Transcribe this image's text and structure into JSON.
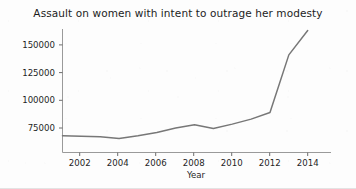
{
  "chart_data": {
    "type": "line",
    "title": "Assault on women with intent to outrage her modesty",
    "xlabel": "Year",
    "ylabel": "",
    "x": [
      2001,
      2002,
      2003,
      2004,
      2005,
      2006,
      2007,
      2008,
      2009,
      2010,
      2011,
      2012,
      2013,
      2014
    ],
    "values": [
      68000,
      67500,
      67000,
      65500,
      68000,
      71000,
      75000,
      78000,
      74500,
      78500,
      83000,
      89000,
      141000,
      163000
    ],
    "series": [
      {
        "name": "Assault on women with intent to outrage her modesty",
        "values": [
          68000,
          67500,
          67000,
          65500,
          68000,
          71000,
          75000,
          78000,
          74500,
          78500,
          83000,
          89000,
          141000,
          163000
        ]
      }
    ],
    "xticks": [
      2002,
      2004,
      2006,
      2008,
      2010,
      2012,
      2014
    ],
    "xtick_labels": [
      "2002",
      "2004",
      "2006",
      "2008",
      "2010",
      "2012",
      "2014"
    ],
    "yticks": [
      75000,
      100000,
      125000,
      150000
    ],
    "ytick_labels": [
      "75000",
      "100000",
      "125000",
      "150000"
    ],
    "xlim": [
      2001,
      2014.6
    ],
    "ylim": [
      58000,
      168000
    ],
    "grid": false,
    "legend": false,
    "line_color": "#777777",
    "text_color": "#1f1f1f",
    "axis_color": "#9a9a9a",
    "background": "#fdfdfd"
  }
}
